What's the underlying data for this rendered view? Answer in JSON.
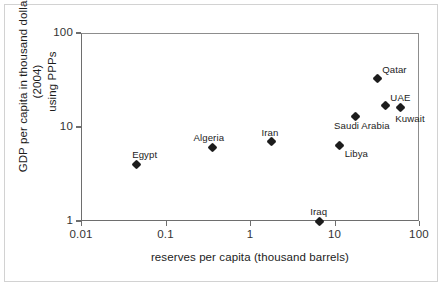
{
  "chart_data": {
    "type": "scatter",
    "title": "",
    "xlabel": "reserves per capita (thousand barrels)",
    "ylabel": "GDP per capita in thousand dollars (2004) using PPPs",
    "xscale": "log",
    "yscale": "log",
    "xlim": [
      0.01,
      100
    ],
    "ylim": [
      1,
      100
    ],
    "xticks": [
      "0.01",
      "0.1",
      "1",
      "10",
      "100"
    ],
    "xtick_values": [
      0.01,
      0.1,
      1,
      10,
      100
    ],
    "yticks": [
      "1",
      "10",
      "100"
    ],
    "ytick_values": [
      1,
      10,
      100
    ],
    "grid": false,
    "legend": "none",
    "marker": "diamond",
    "marker_color": "#1c1c1c",
    "points": [
      {
        "name": "Egypt",
        "x": 0.045,
        "y": 4.0,
        "label_dx": -4,
        "label_dy": -14
      },
      {
        "name": "Algeria",
        "x": 0.36,
        "y": 6.1,
        "label_dx": -19,
        "label_dy": -14
      },
      {
        "name": "Iran",
        "x": 1.8,
        "y": 7.0,
        "label_dx": -10,
        "label_dy": -14
      },
      {
        "name": "Iraq",
        "x": 6.6,
        "y": 1.0,
        "label_dx": -9,
        "label_dy": -14
      },
      {
        "name": "Libya",
        "x": 11.5,
        "y": 6.4,
        "label_dx": 5,
        "label_dy": 4
      },
      {
        "name": "Saudi Arabia",
        "x": 17.5,
        "y": 13.0,
        "label_dx": -21,
        "label_dy": 5
      },
      {
        "name": "Qatar",
        "x": 32.0,
        "y": 33.0,
        "label_dx": 5,
        "label_dy": -13
      },
      {
        "name": "UAE",
        "x": 40.0,
        "y": 17.0,
        "label_dx": 5,
        "label_dy": -12
      },
      {
        "name": "Kuwait",
        "x": 60.0,
        "y": 16.0,
        "label_dx": -5,
        "label_dy": 6
      }
    ]
  },
  "axes": {
    "x_title": "reserves per capita (thousand barrels)",
    "y_title": "GDP per capita in thousand dollars (2004)\nusing PPPs",
    "y_title_line1": "GDP per capita in thousand dollars (2004)",
    "y_title_line2": "using PPPs"
  }
}
